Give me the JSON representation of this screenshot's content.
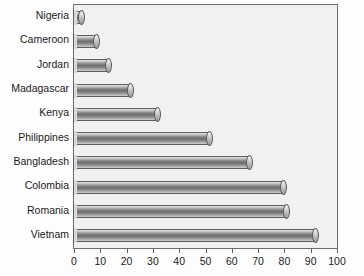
{
  "chart_data": {
    "type": "bar",
    "orientation": "horizontal",
    "title": "",
    "subtitle": "",
    "xlabel": "",
    "ylabel": "",
    "xlim": [
      0,
      100
    ],
    "xticks": [
      0,
      10,
      20,
      30,
      40,
      50,
      60,
      70,
      80,
      90,
      100
    ],
    "xtick_labels": [
      "0",
      "10",
      "20",
      "30",
      "40",
      "50",
      "60",
      "70",
      "80",
      "90",
      "100"
    ],
    "grid": false,
    "legend": false,
    "legend_position": "none",
    "categories": [
      "Nigeria",
      "Cameroon",
      "Jordan",
      "Madagascar",
      "Kenya",
      "Philippines",
      "Bangladesh",
      "Colombia",
      "Romania",
      "Vietnam"
    ],
    "values": [
      4,
      10,
      14.5,
      23,
      33,
      53,
      68,
      81,
      82,
      93
    ],
    "series": [
      {
        "name": "",
        "values": [
          4,
          10,
          14.5,
          23,
          33,
          53,
          68,
          81,
          82,
          93
        ]
      }
    ],
    "colors": {
      "bar_light": "#e4e4e4",
      "bar_mid": "#8d8d8d",
      "bar_dark": "#6f6f6f",
      "bar_outline": "#5d5d5d",
      "plot_background": "#f1f1f1",
      "axis": "#6e6e6e",
      "text": "#1b1b1b"
    },
    "style": "3d-cylinder"
  }
}
